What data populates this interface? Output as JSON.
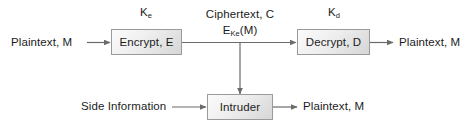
{
  "diagram": {
    "background_color": "#ffffff",
    "line_color": "#6b6b6b",
    "text_color": "#1c1c1c",
    "box_border_color": "#9a9a9a",
    "nodes": [
      {
        "id": "encrypt",
        "label": "Encrypt, E"
      },
      {
        "id": "decrypt",
        "label": "Decrypt, D"
      },
      {
        "id": "intruder",
        "label": "Intruder"
      }
    ],
    "labels": {
      "encryption_key": "K",
      "encryption_key_sub": "e",
      "decryption_key": "K",
      "decryption_key_sub": "d",
      "plaintext_in": "Plaintext, M",
      "plaintext_out": "Plaintext, M",
      "plaintext_intruder_out": "Plaintext, M",
      "ciphertext_line1": "Ciphertext, C",
      "ciphertext_line2_base": "E",
      "ciphertext_line2_sub": "Ke",
      "ciphertext_line2_tail": "(M)",
      "side_information": "Side Information"
    }
  }
}
